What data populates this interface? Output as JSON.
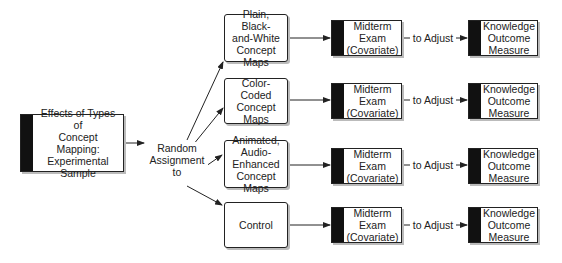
{
  "diagram": {
    "source": {
      "label": "Effects of Types of\nConcept Mapping:\nExperimental\nSample"
    },
    "assignment": {
      "label": "Random\nAssignment\nto"
    },
    "groups": [
      {
        "label": "Plain, Black-\nand-White\nConcept Maps"
      },
      {
        "label": "Color-Coded\nConcept Maps"
      },
      {
        "label": "Animated,\nAudio-\nEnhanced\nConcept Maps"
      },
      {
        "label": "Control"
      }
    ],
    "covariate": {
      "label": "Midterm\nExam\n(Covariate)"
    },
    "adjust": {
      "label": "to Adjust"
    },
    "outcome": {
      "label": "Knowledge\nOutcome\nMeasure"
    }
  }
}
